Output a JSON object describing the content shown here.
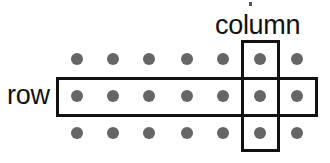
{
  "diagram": {
    "background_color": "#ffffff",
    "dot_color": "#666666",
    "outline_color": "#111111",
    "dot_radius_px": 6,
    "line_width_px": 3,
    "labels": {
      "row": "row",
      "column": "column"
    },
    "grid": {
      "rows": 3,
      "columns": 7,
      "x_positions": [
        77,
        113,
        149,
        187,
        223,
        260,
        297
      ],
      "y_positions": [
        59,
        96,
        133
      ],
      "dots": [
        {
          "row": 0,
          "col": 0,
          "x": 77,
          "y": 59
        },
        {
          "row": 0,
          "col": 1,
          "x": 113,
          "y": 59
        },
        {
          "row": 0,
          "col": 2,
          "x": 149,
          "y": 59
        },
        {
          "row": 0,
          "col": 3,
          "x": 187,
          "y": 59
        },
        {
          "row": 0,
          "col": 4,
          "x": 223,
          "y": 59
        },
        {
          "row": 0,
          "col": 5,
          "x": 260,
          "y": 59
        },
        {
          "row": 0,
          "col": 6,
          "x": 297,
          "y": 59
        },
        {
          "row": 1,
          "col": 0,
          "x": 77,
          "y": 96
        },
        {
          "row": 1,
          "col": 1,
          "x": 113,
          "y": 96
        },
        {
          "row": 1,
          "col": 2,
          "x": 149,
          "y": 96
        },
        {
          "row": 1,
          "col": 3,
          "x": 187,
          "y": 96
        },
        {
          "row": 1,
          "col": 4,
          "x": 223,
          "y": 96
        },
        {
          "row": 1,
          "col": 5,
          "x": 260,
          "y": 96
        },
        {
          "row": 1,
          "col": 6,
          "x": 297,
          "y": 96
        },
        {
          "row": 2,
          "col": 0,
          "x": 77,
          "y": 133
        },
        {
          "row": 2,
          "col": 1,
          "x": 113,
          "y": 133
        },
        {
          "row": 2,
          "col": 2,
          "x": 149,
          "y": 133
        },
        {
          "row": 2,
          "col": 3,
          "x": 187,
          "y": 133
        },
        {
          "row": 2,
          "col": 4,
          "x": 223,
          "y": 133
        },
        {
          "row": 2,
          "col": 5,
          "x": 260,
          "y": 133
        },
        {
          "row": 2,
          "col": 6,
          "x": 297,
          "y": 133
        }
      ]
    },
    "highlights": {
      "row": {
        "label": "row",
        "index": 1,
        "x": 56,
        "y": 77,
        "width": 262,
        "height": 40,
        "dot_count": 7
      },
      "column": {
        "label": "column",
        "index": 5,
        "x": 241,
        "y": 40,
        "width": 39,
        "height": 112,
        "dot_count": 3
      }
    }
  }
}
